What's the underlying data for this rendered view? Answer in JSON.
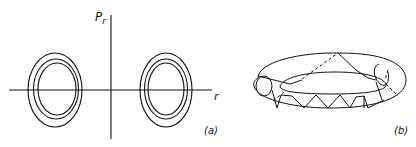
{
  "panel_a": {
    "y_axis_label": "P",
    "y_axis_label_sub": "r",
    "x_axis_label": "r",
    "caption": "(a)"
  },
  "panel_b": {
    "caption": "(b)"
  },
  "colors": {
    "stroke": "#111111",
    "background": "#ffffff"
  }
}
